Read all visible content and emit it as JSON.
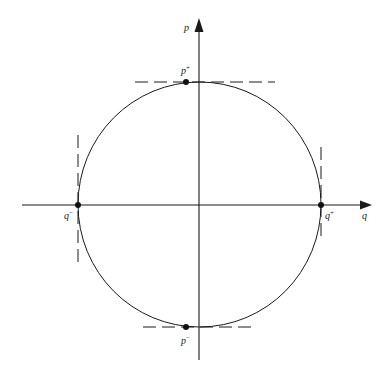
{
  "figure": {
    "type": "phase-portrait",
    "stroke_color": "#1a1a1a",
    "background": "#ffffff"
  },
  "axes": {
    "horizontal": {
      "label": "q",
      "y": 205,
      "x_start": 22,
      "x_end": 372
    },
    "vertical": {
      "label": "p",
      "x": 199,
      "y_start": 360,
      "y_end": 18
    }
  },
  "curve": {
    "shape": "closed-orbit",
    "cx": 199.5,
    "cy": 204.5,
    "rx": 121.5,
    "ry": 122.5
  },
  "points": [
    {
      "id": "p-plus",
      "base": "p",
      "sup": "+",
      "x": 186,
      "y": 82,
      "label_x": 181,
      "label_y": 74
    },
    {
      "id": "p-minus",
      "base": "p",
      "sup": "−",
      "x": 186,
      "y": 327,
      "label_x": 181,
      "label_y": 343
    },
    {
      "id": "q-minus",
      "base": "q",
      "sup": "−",
      "x": 78,
      "y": 205,
      "label_x": 64,
      "label_y": 218
    },
    {
      "id": "q-plus",
      "base": "q",
      "sup": "+",
      "x": 321,
      "y": 205,
      "label_x": 324,
      "label_y": 218
    }
  ],
  "tangents": [
    {
      "id": "tangent-top",
      "x1": 135,
      "y1": 82,
      "x2": 275,
      "y2": 82
    },
    {
      "id": "tangent-bottom",
      "x1": 143,
      "y1": 327,
      "x2": 255,
      "y2": 327
    },
    {
      "id": "tangent-left",
      "x1": 78,
      "y1": 135,
      "x2": 78,
      "y2": 263
    },
    {
      "id": "tangent-right",
      "x1": 321,
      "y1": 147,
      "x2": 321,
      "y2": 242
    }
  ],
  "labels": {
    "p_axis": "p",
    "q_axis": "q",
    "p_plus_base": "p",
    "p_plus_sup": "+",
    "p_minus_base": "p",
    "p_minus_sup": "−",
    "q_minus_base": "q",
    "q_minus_sup": "−",
    "q_plus_base": "q",
    "q_plus_sup": "+"
  }
}
